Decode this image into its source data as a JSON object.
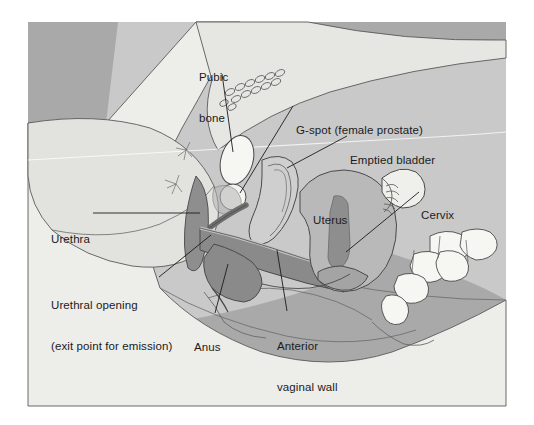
{
  "figure": {
    "width": 534,
    "height": 425
  },
  "colors": {
    "background_outer": "#ffffff",
    "background_dark": "#a9a9a9",
    "background_mid": "#c9c9c9",
    "body_light": "#ededea",
    "body_pale": "#e3e3e0",
    "thigh_tint": "#dedede",
    "organ_mid": "#b9b9b9",
    "organ_dark": "#8e8e8e",
    "organ_darker": "#7c7c7c",
    "bone_white": "#f6f6f3",
    "outline": "#4a4a4a",
    "leader_line": "#1b1b1b",
    "label_text": "#1b1b1b"
  },
  "labels": [
    {
      "id": "pubic-bone",
      "name": "label-pubic-bone",
      "lines": [
        "Pubic",
        "bone"
      ],
      "x": 199,
      "y": 44,
      "align": "left",
      "leader": {
        "x1": 222,
        "y1": 74,
        "x2": 233,
        "y2": 152
      }
    },
    {
      "id": "g-spot",
      "name": "label-g-spot",
      "lines": [
        "G-spot (female prostate)"
      ],
      "x": 296,
      "y": 97,
      "align": "left",
      "leader": {
        "x1": 293,
        "y1": 106,
        "x2": 240,
        "y2": 193
      }
    },
    {
      "id": "emptied-bladder",
      "name": "label-emptied-bladder",
      "lines": [
        "Emptied bladder"
      ],
      "x": 350,
      "y": 127,
      "align": "left",
      "leader": {
        "x1": 347,
        "y1": 136,
        "x2": 287,
        "y2": 168
      }
    },
    {
      "id": "uterus",
      "name": "label-uterus",
      "lines": [
        "Uterus"
      ],
      "x": 313,
      "y": 187,
      "align": "left",
      "leader": null
    },
    {
      "id": "cervix",
      "name": "label-cervix",
      "lines": [
        "Cervix"
      ],
      "x": 421,
      "y": 182,
      "align": "left",
      "leader": {
        "x1": 419,
        "y1": 192,
        "x2": 346,
        "y2": 252
      }
    },
    {
      "id": "urethra",
      "name": "label-urethra",
      "lines": [
        "Urethra"
      ],
      "x": 51,
      "y": 206,
      "align": "left",
      "leader": {
        "x1": 93,
        "y1": 213,
        "x2": 200,
        "y2": 213
      }
    },
    {
      "id": "urethral-opening",
      "name": "label-urethral-opening",
      "lines": [
        "Urethral opening",
        "(exit point for emission)"
      ],
      "x": 51,
      "y": 272,
      "align": "left",
      "leader": {
        "x1": 159,
        "y1": 277,
        "x2": 211,
        "y2": 235
      }
    },
    {
      "id": "anus",
      "name": "label-anus",
      "lines": [
        "Anus"
      ],
      "x": 194,
      "y": 314,
      "align": "left",
      "leader": {
        "x1": 215,
        "y1": 313,
        "x2": 228,
        "y2": 264
      }
    },
    {
      "id": "anterior-vaginal-wall",
      "name": "label-anterior-vaginal-wall",
      "lines": [
        "Anterior",
        "vaginal wall"
      ],
      "x": 277,
      "y": 313,
      "align": "left",
      "leader": {
        "x1": 287,
        "y1": 311,
        "x2": 277,
        "y2": 250
      }
    }
  ]
}
